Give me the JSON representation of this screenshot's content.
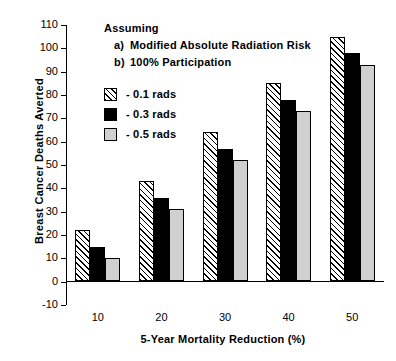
{
  "chart_data": {
    "type": "bar",
    "title": "",
    "xlabel": "5-Year Mortality Reduction (%)",
    "ylabel": "Breast Cancer Deaths Averted",
    "categories": [
      "10",
      "20",
      "30",
      "40",
      "50"
    ],
    "series": [
      {
        "name": "- 0.1 rads",
        "values": [
          22,
          43,
          64,
          85,
          105
        ],
        "fill": "diagonal-hatch",
        "color": "#ffffff"
      },
      {
        "name": "- 0.3 rads",
        "values": [
          15,
          36,
          57,
          78,
          98
        ],
        "fill": "solid",
        "color": "#000000"
      },
      {
        "name": "- 0.5 rads",
        "values": [
          10,
          31,
          52,
          73,
          93
        ],
        "fill": "solid",
        "color": "#d0d0d0"
      }
    ],
    "ylim": [
      -10,
      110
    ],
    "ytick_labels": [
      "110",
      "100",
      "90",
      "80",
      "70",
      "60",
      "50",
      "40",
      "30",
      "20",
      "10",
      "0",
      "-10"
    ],
    "ytick_values": [
      110,
      100,
      90,
      80,
      70,
      60,
      50,
      40,
      30,
      20,
      10,
      0,
      -10
    ],
    "grid": false,
    "legend_position": "upper-left-inside",
    "annotations": {
      "heading": "Assuming",
      "items": [
        {
          "marker": "a)",
          "text": "Modified Absolute Radiation Risk"
        },
        {
          "marker": "b)",
          "text": "100% Participation"
        }
      ]
    }
  }
}
